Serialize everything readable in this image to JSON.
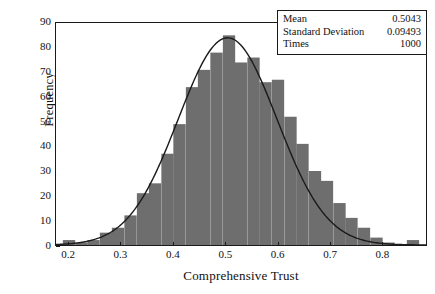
{
  "chart_data": {
    "type": "bar",
    "title": "",
    "subtitle": "",
    "xlabel": "Comprehensive Trust",
    "ylabel": "Frequency",
    "xlim": [
      0.175,
      0.885
    ],
    "ylim": [
      0,
      90
    ],
    "grid": false,
    "bin_width": 0.0236,
    "bar_color": "#6e6e6e",
    "curve_color": "#1a1a1a",
    "legend_position": "top-right",
    "xticks": [
      0.2,
      0.3,
      0.4,
      0.5,
      0.6,
      0.7,
      0.8
    ],
    "xtick_labels": [
      "0.2",
      "0.3",
      "0.4",
      "0.5",
      "0.6",
      "0.7",
      "0.8"
    ],
    "yticks": [
      0,
      10,
      20,
      30,
      40,
      50,
      60,
      70,
      80,
      90
    ],
    "ytick_labels": [
      "0",
      "10",
      "20",
      "30",
      "40",
      "50",
      "60",
      "70",
      "80",
      "90"
    ],
    "bin_centers": [
      0.2,
      0.224,
      0.247,
      0.271,
      0.294,
      0.318,
      0.342,
      0.365,
      0.389,
      0.412,
      0.436,
      0.459,
      0.483,
      0.507,
      0.53,
      0.554,
      0.577,
      0.601,
      0.625,
      0.648,
      0.672,
      0.695,
      0.719,
      0.742,
      0.766,
      0.79,
      0.813,
      0.837,
      0.86
    ],
    "values": [
      2,
      1,
      2,
      5,
      7,
      12,
      21,
      25,
      37,
      49,
      64,
      71,
      78,
      85,
      74,
      76,
      66,
      67,
      52,
      41,
      30,
      26,
      17,
      11,
      7,
      3,
      1,
      0,
      2
    ],
    "curve": {
      "type": "normal",
      "mean": 0.5043,
      "std": 0.09493,
      "peak_value": 84
    }
  },
  "stats_box": {
    "rows": [
      {
        "key": "Mean",
        "value": "0.5043"
      },
      {
        "key": "Standard Deviation",
        "value": "0.09493"
      },
      {
        "key": "Times",
        "value": "1000"
      }
    ]
  }
}
